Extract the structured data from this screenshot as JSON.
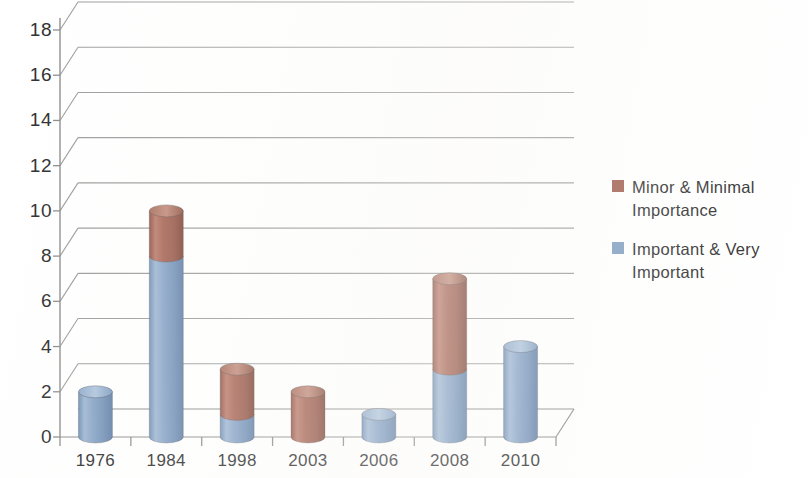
{
  "chart_data": {
    "type": "bar",
    "subtype": "stacked-3d-cylinder",
    "title": "",
    "xlabel": "",
    "ylabel": "",
    "categories": [
      "1976",
      "1984",
      "1998",
      "2003",
      "2006",
      "2008",
      "2010"
    ],
    "ylim": [
      0,
      18
    ],
    "ytick_step": 2,
    "ytick_labels": [
      "18",
      "16",
      "14",
      "12",
      "10",
      "8",
      "6",
      "4",
      "2",
      "0"
    ],
    "ytick_values": [
      18,
      16,
      14,
      12,
      10,
      8,
      6,
      4,
      2,
      0
    ],
    "grid": true,
    "grid_axis": "y",
    "legend_position": "right",
    "stacked": true,
    "stack_order": [
      "Important & Very Important",
      "Minor & Minimal Importance"
    ],
    "series": [
      {
        "name": "Important & Very Important",
        "color": "#7D9CC0",
        "values": [
          2,
          8,
          1,
          0,
          1,
          3,
          4
        ]
      },
      {
        "name": "Minor & Minimal Importance",
        "color": "#9E5B4A",
        "values": [
          0,
          2,
          2,
          2,
          0,
          4,
          0
        ]
      }
    ],
    "totals": [
      2,
      10,
      3,
      2,
      1,
      7,
      4
    ]
  },
  "legend": {
    "entries": [
      {
        "label": "Minor & Minimal\nImportance",
        "color": "#9E5B4A"
      },
      {
        "label": "Important & Very\nImportant",
        "color": "#7D9CC0"
      }
    ]
  },
  "axis": {
    "y_labels": [
      "18",
      "16",
      "14",
      "12",
      "10",
      "8",
      "6",
      "4",
      "2",
      "0"
    ],
    "x_labels": [
      "1976",
      "1984",
      "1998",
      "2003",
      "2006",
      "2008",
      "2010"
    ]
  },
  "colors": {
    "series_minor": "#9E5B4A",
    "series_important": "#7D9CC0",
    "axis": "#8a8a8a",
    "grid": "#9a9a9a",
    "text": "#2b2b2b",
    "background": "#ffffff"
  }
}
